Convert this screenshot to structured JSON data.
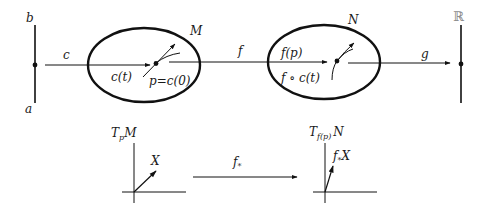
{
  "diagram": {
    "interval": {
      "top_label": "b",
      "bottom_label": "a"
    },
    "manifold_M": {
      "label": "M",
      "curve_label": "c(t)",
      "point_label": "p=c(0)"
    },
    "manifold_N": {
      "label": "N",
      "point_label": "f(p)",
      "curve_label": "f ∘ c(t)"
    },
    "reals": {
      "label": "ℝ"
    },
    "maps": {
      "c": "c",
      "f": "f",
      "g": "g",
      "pushforward": "f",
      "pushforward_sub": "*"
    },
    "tangent_space_M": {
      "label_main": "T",
      "label_sub": "p",
      "label_suffix": "M",
      "vector_label": "X"
    },
    "tangent_space_N": {
      "label_main": "T",
      "label_sub": "f(p)",
      "label_suffix": "N",
      "vector_label_main": "f",
      "vector_label_sub": "*",
      "vector_label_suffix": "X"
    },
    "colors": {
      "ink": "#111111",
      "reals_label": "#8a8a8a",
      "background": "#ffffff"
    }
  }
}
